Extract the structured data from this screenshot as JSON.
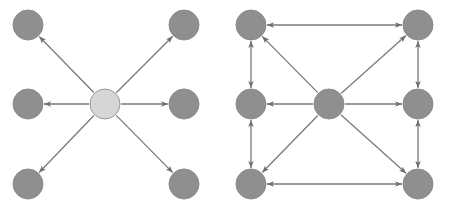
{
  "colors": {
    "background": "#ffffff",
    "node_fill": "#8f8f8f",
    "node_stroke": "#8a8a8a",
    "center_light_fill": "#d6d6d6",
    "center_light_stroke": "#9a9a9a",
    "edge": "#7a7a7a"
  },
  "diagrams": [
    {
      "id": "star",
      "description": "Star topology: central node sends to six peripheral nodes",
      "nodes": [
        {
          "id": "c",
          "role": "center",
          "style": "light"
        },
        {
          "id": "tl",
          "role": "peripheral"
        },
        {
          "id": "ml",
          "role": "peripheral"
        },
        {
          "id": "bl",
          "role": "peripheral"
        },
        {
          "id": "tr",
          "role": "peripheral"
        },
        {
          "id": "mr",
          "role": "peripheral"
        },
        {
          "id": "br",
          "role": "peripheral"
        }
      ],
      "edges": [
        {
          "from": "c",
          "to": "tl",
          "directed": "forward"
        },
        {
          "from": "c",
          "to": "ml",
          "directed": "forward"
        },
        {
          "from": "c",
          "to": "bl",
          "directed": "forward"
        },
        {
          "from": "c",
          "to": "tr",
          "directed": "forward"
        },
        {
          "from": "c",
          "to": "mr",
          "directed": "forward"
        },
        {
          "from": "c",
          "to": "br",
          "directed": "forward"
        }
      ]
    },
    {
      "id": "mesh",
      "description": "Star plus bidirectional perimeter links among peripheral nodes",
      "nodes": [
        {
          "id": "c",
          "role": "center",
          "style": "dark"
        },
        {
          "id": "tl",
          "role": "peripheral"
        },
        {
          "id": "ml",
          "role": "peripheral"
        },
        {
          "id": "bl",
          "role": "peripheral"
        },
        {
          "id": "tr",
          "role": "peripheral"
        },
        {
          "id": "mr",
          "role": "peripheral"
        },
        {
          "id": "br",
          "role": "peripheral"
        }
      ],
      "edges": [
        {
          "from": "c",
          "to": "tl",
          "directed": "forward"
        },
        {
          "from": "c",
          "to": "ml",
          "directed": "forward"
        },
        {
          "from": "c",
          "to": "bl",
          "directed": "forward"
        },
        {
          "from": "c",
          "to": "tr",
          "directed": "forward"
        },
        {
          "from": "c",
          "to": "mr",
          "directed": "forward"
        },
        {
          "from": "c",
          "to": "br",
          "directed": "forward"
        },
        {
          "from": "tl",
          "to": "tr",
          "directed": "both"
        },
        {
          "from": "bl",
          "to": "br",
          "directed": "both"
        },
        {
          "from": "tl",
          "to": "ml",
          "directed": "both"
        },
        {
          "from": "ml",
          "to": "bl",
          "directed": "both"
        },
        {
          "from": "tr",
          "to": "mr",
          "directed": "both"
        },
        {
          "from": "mr",
          "to": "br",
          "directed": "both"
        }
      ]
    }
  ]
}
